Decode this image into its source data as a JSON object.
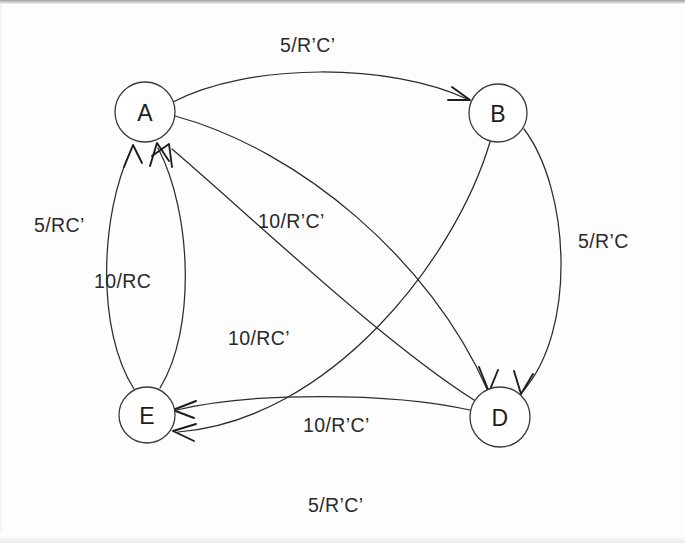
{
  "diagram": {
    "type": "state-machine",
    "background_color": "#fdfdfd",
    "stroke_color": "#2b2b2b",
    "nodes": [
      {
        "id": "A",
        "label": "A",
        "cx": 145,
        "cy": 112,
        "r": 30
      },
      {
        "id": "B",
        "label": "B",
        "cx": 498,
        "cy": 113,
        "r": 29
      },
      {
        "id": "D",
        "label": "D",
        "cx": 500,
        "cy": 417,
        "r": 30
      },
      {
        "id": "E",
        "label": "E",
        "cx": 147,
        "cy": 415,
        "r": 28
      }
    ],
    "edges": [
      {
        "id": "a-to-b",
        "from": "A",
        "to": "B",
        "label": "5/R’C’",
        "label_x": 280,
        "label_y": 52
      },
      {
        "id": "b-to-d",
        "from": "B",
        "to": "D",
        "label": "5/R’C",
        "label_x": 578,
        "label_y": 248
      },
      {
        "id": "b-to-e",
        "from": "B",
        "to": "E",
        "label": "5/R’C’",
        "label_x": 308,
        "label_y": 512
      },
      {
        "id": "a-to-d",
        "from": "A",
        "to": "D",
        "label": "10/R’C’",
        "label_x": 258,
        "label_y": 228
      },
      {
        "id": "d-to-a",
        "from": "D",
        "to": "A",
        "label": "10/RC’",
        "label_x": 228,
        "label_y": 345
      },
      {
        "id": "d-to-e",
        "from": "D",
        "to": "E",
        "label": "10/R’C’",
        "label_x": 303,
        "label_y": 432
      },
      {
        "id": "e-to-a-left",
        "from": "E",
        "to": "A",
        "label": "5/RC’",
        "label_x": 34,
        "label_y": 232
      },
      {
        "id": "e-to-a-right",
        "from": "E",
        "to": "A",
        "label": "10/RC",
        "label_x": 94,
        "label_y": 288
      }
    ],
    "edge_labels_list": [
      "5/R’C’",
      "5/R’C",
      "5/R’C’",
      "10/R’C’",
      "10/RC’",
      "10/R’C’",
      "5/RC’",
      "10/RC"
    ],
    "node_labels_list": [
      "A",
      "B",
      "D",
      "E"
    ]
  }
}
